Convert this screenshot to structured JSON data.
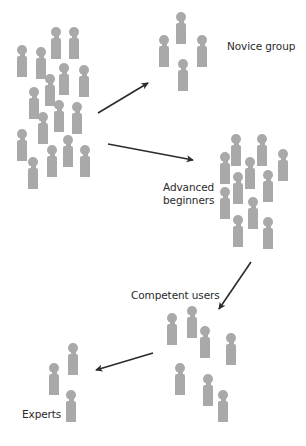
{
  "colors": {
    "figure": "#a9a9a9",
    "arrow": "#2b2b2b",
    "text": "#2a2a2a",
    "background": "#ffffff"
  },
  "groups": [
    {
      "id": "population",
      "label": "",
      "figures": [
        [
          17,
          45
        ],
        [
          36,
          47
        ],
        [
          51,
          27
        ],
        [
          69,
          27
        ],
        [
          59,
          63
        ],
        [
          79,
          65
        ],
        [
          45,
          74
        ],
        [
          29,
          87
        ],
        [
          54,
          100
        ],
        [
          72,
          102
        ],
        [
          38,
          112
        ],
        [
          17,
          129
        ],
        [
          63,
          135
        ],
        [
          47,
          145
        ],
        [
          80,
          145
        ],
        [
          28,
          157
        ]
      ]
    },
    {
      "id": "novice",
      "label": "Novice group",
      "label_pos": [
        227,
        40
      ],
      "figures": [
        [
          176,
          12
        ],
        [
          159,
          35
        ],
        [
          197,
          35
        ],
        [
          178,
          59
        ]
      ]
    },
    {
      "id": "advanced",
      "label_lines": [
        "Advanced",
        "beginners"
      ],
      "label_pos": [
        163,
        181
      ],
      "figures": [
        [
          231,
          134
        ],
        [
          257,
          134
        ],
        [
          220,
          152
        ],
        [
          245,
          157
        ],
        [
          278,
          149
        ],
        [
          233,
          172
        ],
        [
          263,
          170
        ],
        [
          220,
          187
        ],
        [
          248,
          197
        ],
        [
          233,
          215
        ],
        [
          263,
          217
        ]
      ]
    },
    {
      "id": "competent",
      "label": "Competent users",
      "label_pos": [
        131,
        289
      ],
      "figures": [
        [
          167,
          313
        ],
        [
          187,
          306
        ],
        [
          200,
          326
        ],
        [
          226,
          333
        ],
        [
          175,
          363
        ],
        [
          203,
          374
        ],
        [
          218,
          390
        ]
      ]
    },
    {
      "id": "experts",
      "label": "Experts",
      "label_pos": [
        22,
        408
      ],
      "figures": [
        [
          68,
          343
        ],
        [
          49,
          363
        ],
        [
          66,
          390
        ]
      ]
    }
  ],
  "labels": {
    "novice": "Novice group",
    "advanced_line1": "Advanced",
    "advanced_line2": "beginners",
    "competent": "Competent users",
    "experts": "Experts"
  },
  "arrows": [
    {
      "from": "population",
      "to": "novice",
      "x1": 98,
      "y1": 113,
      "x2": 148,
      "y2": 83
    },
    {
      "from": "population",
      "to": "advanced",
      "x1": 108,
      "y1": 144,
      "x2": 193,
      "y2": 160
    },
    {
      "from": "advanced",
      "to": "competent",
      "x1": 251,
      "y1": 262,
      "x2": 219,
      "y2": 309
    },
    {
      "from": "competent",
      "to": "experts",
      "x1": 153,
      "y1": 353,
      "x2": 96,
      "y2": 370
    }
  ]
}
